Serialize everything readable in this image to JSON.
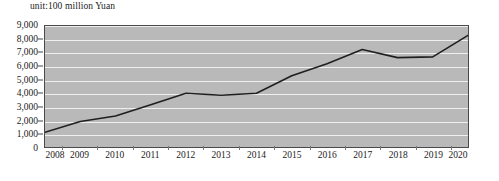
{
  "chart": {
    "unit_label": "unit:100 million Yuan",
    "line_color": "#1f1f1f",
    "plot_background": "#b9b9b9",
    "gridline_color": "#efefef",
    "axis_color": "#4a4a4a"
  },
  "chart_data": {
    "type": "line",
    "title": "",
    "subtitle": "",
    "annotation": "unit:100 million Yuan",
    "xlabel": "",
    "ylabel": "",
    "categories": [
      "2008",
      "2009",
      "2010",
      "2011",
      "2012",
      "2013",
      "2014",
      "2015",
      "2016",
      "2017",
      "2018",
      "2019",
      "2020"
    ],
    "x": [
      2008,
      2009,
      2010,
      2011,
      2012,
      2013,
      2014,
      2015,
      2016,
      2017,
      2018,
      2019,
      2020
    ],
    "values": [
      1100,
      1900,
      2300,
      3150,
      4000,
      3850,
      4000,
      5300,
      6200,
      7250,
      6650,
      6700,
      8300
    ],
    "series": [
      {
        "name": "",
        "values": [
          1100,
          1900,
          2300,
          3150,
          4000,
          3850,
          4000,
          5300,
          6200,
          7250,
          6650,
          6700,
          8300
        ]
      }
    ],
    "ylim": [
      0,
      9000
    ],
    "ytick_values": [
      0,
      1000,
      2000,
      3000,
      4000,
      5000,
      6000,
      7000,
      8000,
      9000
    ],
    "ytick_labels": [
      "0",
      "1,000",
      "2,000",
      "3,000",
      "4,000",
      "5,000",
      "6,000",
      "7,000",
      "8,000",
      "9,000"
    ],
    "xtick_labels": [
      "2008",
      "2009",
      "2010",
      "2011",
      "2012",
      "2013",
      "2014",
      "2015",
      "2016",
      "2017",
      "2018",
      "2019",
      "2020"
    ],
    "grid": true,
    "grid_axis": "y",
    "legend": false,
    "legend_position": "none",
    "markers": false
  }
}
